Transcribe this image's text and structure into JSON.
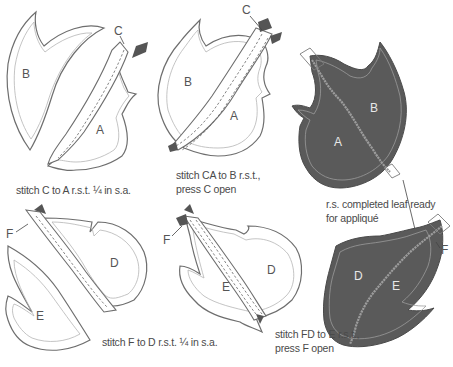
{
  "figure": {
    "steps": [
      {
        "id": "step1",
        "caption": "stitch C to A r.s.t. ¼ in s.a.",
        "pieces": [
          "B",
          "C",
          "A"
        ]
      },
      {
        "id": "step2",
        "caption_line1": "stitch CA to B r.s.t.,",
        "caption_line2": "press C open",
        "pieces": [
          "C",
          "B",
          "A"
        ]
      },
      {
        "id": "step3",
        "caption_line1": "r.s. completed leaf ready",
        "caption_line2": "for appliqué",
        "pieces": [
          "B",
          "A"
        ]
      },
      {
        "id": "step4",
        "caption": "stitch F to D r.s.t. ¼ in s.a.",
        "pieces": [
          "F",
          "D",
          "E"
        ]
      },
      {
        "id": "step5",
        "caption_line1": "stitch FD to E r.s.t.,",
        "caption_line2": "press F open",
        "pieces": [
          "F",
          "D",
          "E"
        ]
      },
      {
        "id": "step6",
        "pieces": [
          "D",
          "E",
          "F"
        ]
      }
    ],
    "colors": {
      "outline": "#6e6e6e",
      "seam_allowance": "#b5b5b5",
      "fabric_right_side": "#5a5a5a",
      "vein": "#9c9c9c",
      "tab": "#555555",
      "caption": "#4a4a4a"
    }
  }
}
